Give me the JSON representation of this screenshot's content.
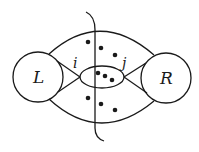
{
  "diagram": {
    "nodes": [
      {
        "id": "L",
        "label": "L",
        "shape": "circle"
      },
      {
        "id": "R",
        "label": "R",
        "shape": "circle"
      }
    ],
    "vertices": [
      {
        "id": "i",
        "label": "i"
      },
      {
        "id": "j",
        "label": "j"
      }
    ],
    "regions": {
      "top_dots": 3,
      "middle_dots": 3,
      "bottom_dots": 3
    },
    "cut_line": "vertical curve crossing all edges"
  },
  "colors": {
    "stroke": "#1a1a1a",
    "background": "#ffffff"
  }
}
